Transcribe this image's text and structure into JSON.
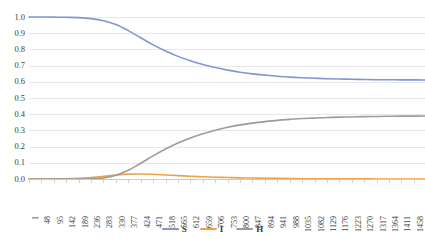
{
  "chart_data": {
    "type": "line",
    "title": "",
    "xlabel": "",
    "ylabel": "",
    "grid": true,
    "legend_position": "bottom",
    "ylim": [
      0.0,
      1.0
    ],
    "ytick_labels": [
      "1.0",
      "0.9",
      "0.8",
      "0.7",
      "0.6",
      "0.5",
      "0.4",
      "0.3",
      "0.2",
      "0.1",
      "0.0"
    ],
    "ytick_values": [
      1.0,
      0.9,
      0.8,
      0.7,
      0.6,
      0.5,
      0.4,
      0.3,
      0.2,
      0.1,
      0.0
    ],
    "xlim": [
      1,
      1500
    ],
    "x_tick_labels": [
      "1",
      "48",
      "95",
      "142",
      "189",
      "236",
      "283",
      "330",
      "377",
      "424",
      "471",
      "518",
      "565",
      "612",
      "659",
      "706",
      "753",
      "800",
      "847",
      "894",
      "941",
      "988",
      "1035",
      "1082",
      "1129",
      "1176",
      "1223",
      "1270",
      "1317",
      "1364",
      "1411",
      "1458"
    ],
    "x_tick_values": [
      1,
      48,
      95,
      142,
      189,
      236,
      283,
      330,
      377,
      424,
      471,
      518,
      565,
      612,
      659,
      706,
      753,
      800,
      847,
      894,
      941,
      988,
      1035,
      1082,
      1129,
      1176,
      1223,
      1270,
      1317,
      1364,
      1411,
      1458
    ],
    "series": [
      {
        "name": "S",
        "color": "#8295d1",
        "x": [
          1,
          48,
          95,
          142,
          189,
          236,
          283,
          330,
          377,
          424,
          471,
          518,
          565,
          612,
          659,
          706,
          753,
          800,
          847,
          894,
          941,
          988,
          1035,
          1082,
          1129,
          1176,
          1223,
          1270,
          1317,
          1364,
          1411,
          1458,
          1500
        ],
        "values": [
          1.0,
          1.0,
          0.999,
          0.998,
          0.996,
          0.99,
          0.977,
          0.953,
          0.916,
          0.872,
          0.828,
          0.79,
          0.757,
          0.73,
          0.707,
          0.688,
          0.672,
          0.659,
          0.649,
          0.641,
          0.634,
          0.629,
          0.625,
          0.622,
          0.619,
          0.617,
          0.616,
          0.614,
          0.613,
          0.613,
          0.612,
          0.612,
          0.611
        ]
      },
      {
        "name": "I",
        "color": "#eda24a",
        "x": [
          1,
          48,
          95,
          142,
          189,
          236,
          283,
          330,
          377,
          424,
          471,
          518,
          565,
          612,
          659,
          706,
          753,
          800,
          847,
          894,
          941,
          988,
          1035,
          1082,
          1129,
          1176,
          1223,
          1270,
          1317,
          1364,
          1411,
          1458,
          1500
        ],
        "values": [
          0.0,
          0.0,
          0.001,
          0.002,
          0.004,
          0.009,
          0.016,
          0.024,
          0.03,
          0.031,
          0.029,
          0.025,
          0.021,
          0.017,
          0.014,
          0.011,
          0.009,
          0.007,
          0.006,
          0.005,
          0.004,
          0.003,
          0.002,
          0.002,
          0.001,
          0.001,
          0.001,
          0.001,
          0.0,
          0.0,
          0.0,
          0.0,
          0.0
        ]
      },
      {
        "name": "H",
        "color": "#9b9b9b",
        "x": [
          1,
          48,
          95,
          142,
          189,
          236,
          283,
          330,
          377,
          424,
          471,
          518,
          565,
          612,
          659,
          706,
          753,
          800,
          847,
          894,
          941,
          988,
          1035,
          1082,
          1129,
          1176,
          1223,
          1270,
          1317,
          1364,
          1411,
          1458,
          1500
        ],
        "values": [
          0.0,
          0.0,
          0.0,
          0.0,
          0.0,
          0.001,
          0.007,
          0.023,
          0.054,
          0.097,
          0.143,
          0.185,
          0.222,
          0.253,
          0.279,
          0.301,
          0.319,
          0.334,
          0.345,
          0.354,
          0.362,
          0.368,
          0.373,
          0.376,
          0.38,
          0.382,
          0.383,
          0.385,
          0.386,
          0.387,
          0.388,
          0.388,
          0.389
        ]
      }
    ]
  },
  "legend": {
    "items": [
      {
        "label": "S",
        "color": "#8295d1"
      },
      {
        "label": "I",
        "color": "#eda24a"
      },
      {
        "label": "H",
        "color": "#9b9b9b"
      }
    ]
  }
}
